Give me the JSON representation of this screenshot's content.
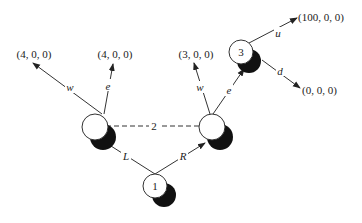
{
  "diagram": {
    "nodes": {
      "left": {
        "label": ""
      },
      "right": {
        "label": ""
      },
      "n1": {
        "label": "1"
      },
      "n3": {
        "label": "3"
      }
    },
    "edges": {
      "L": "L",
      "R": "R",
      "left_w": "w",
      "left_e": "e",
      "right_w": "w",
      "right_e": "e",
      "u": "u",
      "d": "d",
      "info_set": "2"
    },
    "payoffs": {
      "left_w": "(4, 0, 0)",
      "left_e": "(4, 0, 0)",
      "right_w": "(3, 0, 0)",
      "u": "(100, 0, 0)",
      "d": "(0, 0, 0)"
    },
    "colors": {
      "line": "#333333",
      "shadow": "#111111",
      "node_fill": "#ffffff"
    }
  }
}
